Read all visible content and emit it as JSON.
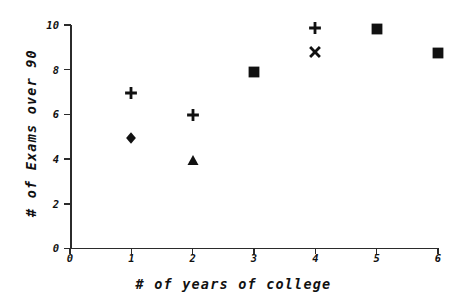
{
  "chart_data": {
    "type": "scatter",
    "title": "",
    "xlabel": "# of years of college",
    "ylabel": "# of Exams over 90",
    "xlim": [
      0,
      6
    ],
    "ylim": [
      0,
      10
    ],
    "xticks": [
      "0",
      "1",
      "2",
      "3",
      "4",
      "5",
      "6"
    ],
    "yticks": [
      "0",
      "2",
      "4",
      "6",
      "8",
      "10"
    ],
    "grid": false,
    "legend": "none",
    "marker_color": "#111111",
    "points": [
      {
        "x": 1,
        "y": 6.95,
        "marker": "plus"
      },
      {
        "x": 1,
        "y": 4.95,
        "marker": "diamond"
      },
      {
        "x": 2,
        "y": 5.95,
        "marker": "plus"
      },
      {
        "x": 2,
        "y": 3.95,
        "marker": "triangle"
      },
      {
        "x": 3,
        "y": 7.9,
        "marker": "square"
      },
      {
        "x": 4,
        "y": 9.85,
        "marker": "plus"
      },
      {
        "x": 4,
        "y": 8.8,
        "marker": "cross"
      },
      {
        "x": 5,
        "y": 9.8,
        "marker": "square"
      },
      {
        "x": 6,
        "y": 8.75,
        "marker": "square"
      }
    ]
  }
}
